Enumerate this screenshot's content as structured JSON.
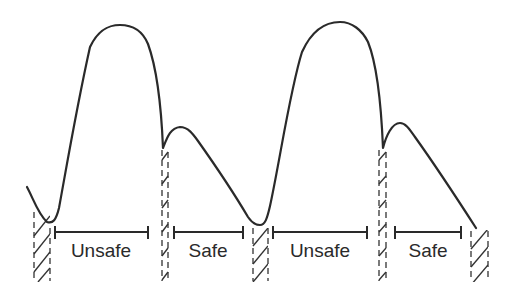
{
  "diagram": {
    "type": "arterial pressure waveform with safe/unsafe timing zones",
    "stroke_color": "#2a2a2a",
    "background": "#ffffff",
    "cycles": 2,
    "segments": [
      {
        "label": "Unsafe",
        "bracket": [
          55,
          148
        ],
        "label_x": 101
      },
      {
        "label": "Safe",
        "bracket": [
          174,
          243
        ],
        "label_x": 208
      },
      {
        "label": "Unsafe",
        "bracket": [
          273,
          367
        ],
        "label_x": 320
      },
      {
        "label": "Safe",
        "bracket": [
          395,
          461
        ],
        "label_x": 428
      }
    ],
    "hatched_markers": [
      {
        "name": "marker-1",
        "x": 33,
        "width": 17,
        "top": 212
      },
      {
        "name": "marker-2",
        "x": 162,
        "width": 7,
        "top": 148
      },
      {
        "name": "marker-3",
        "x": 252,
        "width": 16,
        "top": 228
      },
      {
        "name": "marker-4",
        "x": 379,
        "width": 7,
        "top": 148
      },
      {
        "name": "marker-5",
        "x": 470,
        "width": 18,
        "top": 230
      }
    ]
  }
}
